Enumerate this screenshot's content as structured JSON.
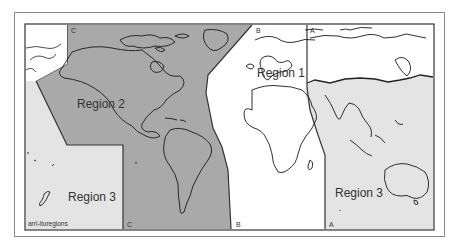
{
  "map": {
    "title": "ITU Regions",
    "regions": [
      {
        "id": "region-1",
        "label": "Region 1",
        "color": "#ffffff"
      },
      {
        "id": "region-2",
        "label": "Region 2",
        "color": "#a9a9a9"
      },
      {
        "id": "region-3-west",
        "label": "Region 3",
        "color": "#e4e4e4"
      },
      {
        "id": "region-3-east",
        "label": "Region 3",
        "color": "#e4e4e4"
      }
    ],
    "boundary_lines": [
      {
        "id": "line-a",
        "label": "A"
      },
      {
        "id": "line-b",
        "label": "B"
      },
      {
        "id": "line-c",
        "label": "C"
      }
    ],
    "markers": {
      "a_top": "A",
      "a_bottom": "A",
      "b_top": "B",
      "b_bottom": "B",
      "c_top": "C",
      "c_bottom": "C"
    },
    "caption": "arrl-ituregions",
    "colors": {
      "border": "#333333",
      "coast": "#1a1a1a",
      "frame": "#8a8a8a"
    }
  }
}
